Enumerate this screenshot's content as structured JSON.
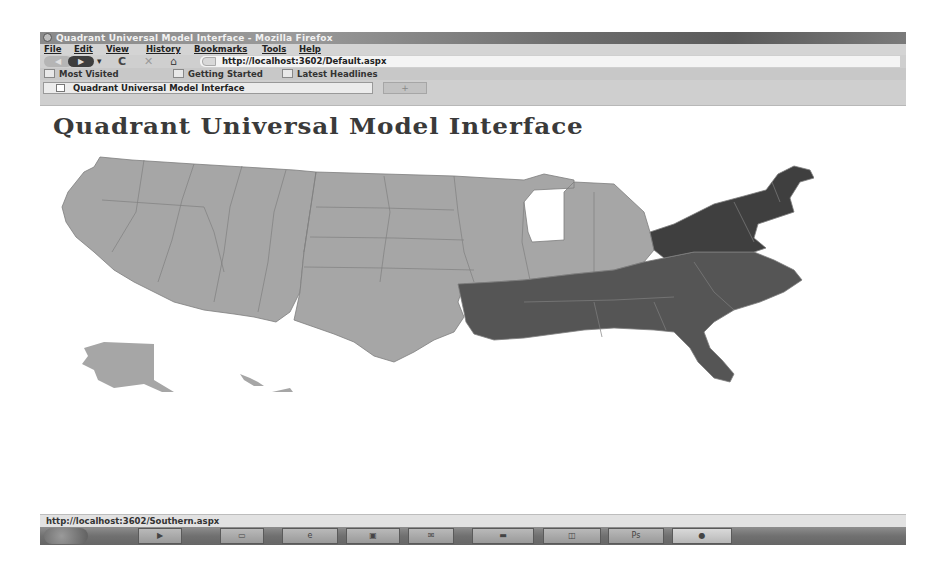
{
  "window": {
    "title": "Quadrant Universal Model Interface - Mozilla Firefox",
    "app_icon": "firefox-icon"
  },
  "menu": {
    "items": [
      {
        "label": "File",
        "x": 4
      },
      {
        "label": "Edit",
        "x": 34
      },
      {
        "label": "View",
        "x": 66
      },
      {
        "label": "History",
        "x": 106
      },
      {
        "label": "Bookmarks",
        "x": 154
      },
      {
        "label": "Tools",
        "x": 222
      },
      {
        "label": "Help",
        "x": 259
      }
    ]
  },
  "nav": {
    "back_icon": "◀",
    "forward_icon": "▶",
    "dropdown_icon": "▾",
    "reload_icon": "C",
    "stop_icon": "✕",
    "home_icon": "⌂",
    "url": "http://localhost:3602/Default.aspx"
  },
  "bookmarks": {
    "items": [
      {
        "label": "Most Visited",
        "x": 4
      },
      {
        "label": "Getting Started",
        "x": 133
      },
      {
        "label": "Latest Headlines",
        "x": 242
      }
    ]
  },
  "tabs": {
    "items": [
      {
        "label": "Quadrant Universal Model Interface",
        "active": true
      }
    ],
    "new_tab_label": "+"
  },
  "page": {
    "heading": "Quadrant Universal Model Interface",
    "map": {
      "description": "US map with clickable regions; Southern region highlighted",
      "regions": [
        {
          "name": "Western",
          "color": "#a6a6a6"
        },
        {
          "name": "Central",
          "color": "#a6a6a6"
        },
        {
          "name": "Southern",
          "color": "#555555"
        },
        {
          "name": "Northeastern",
          "color": "#3f3f3f"
        }
      ],
      "hovered_region": "Southern"
    }
  },
  "status": {
    "text": "http://localhost:3602/Southern.aspx"
  },
  "taskbar": {
    "buttons": [
      {
        "icon": "media-player-icon",
        "glyph": "▶",
        "x": 98,
        "w": 44
      },
      {
        "icon": "explorer-icon",
        "glyph": "▭",
        "x": 180,
        "w": 44
      },
      {
        "icon": "ie-icon",
        "glyph": "e",
        "x": 242,
        "w": 56
      },
      {
        "icon": "app-icon",
        "glyph": "▣",
        "x": 306,
        "w": 54
      },
      {
        "icon": "mail-icon",
        "glyph": "✉",
        "x": 368,
        "w": 46
      },
      {
        "icon": "wmp-icon",
        "glyph": "▬",
        "x": 432,
        "w": 62
      },
      {
        "icon": "app2-icon",
        "glyph": "◫",
        "x": 503,
        "w": 58
      },
      {
        "icon": "photoshop-icon",
        "glyph": "Ps",
        "x": 568,
        "w": 56
      },
      {
        "icon": "firefox-icon",
        "glyph": "●",
        "x": 632,
        "w": 60,
        "active": true
      }
    ]
  }
}
